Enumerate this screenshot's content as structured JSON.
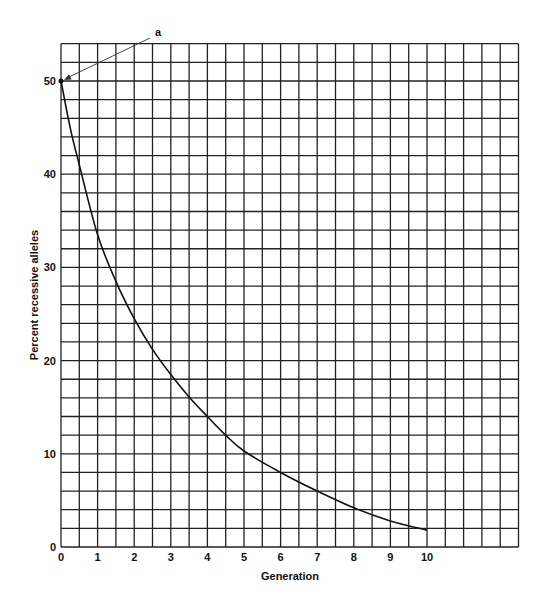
{
  "chart_data": {
    "type": "line",
    "title": "",
    "xlabel": "Generation",
    "ylabel": "Percent recessive alleles",
    "x_ticks": [
      "0",
      "1",
      "2",
      "3",
      "4",
      "5",
      "6",
      "7",
      "8",
      "9",
      "10"
    ],
    "y_ticks": [
      "0",
      "10",
      "20",
      "30",
      "40",
      "50"
    ],
    "xlim": [
      0,
      12.5
    ],
    "ylim": [
      0,
      54
    ],
    "grid": true,
    "grid_step_x": 0.5,
    "grid_step_y": 2,
    "annotation": {
      "label": "a",
      "points_to": [
        0,
        50
      ]
    },
    "series": [
      {
        "name": "Percent recessive alleles",
        "x": [
          0,
          0.25,
          0.5,
          1,
          1.5,
          2,
          2.5,
          3,
          3.5,
          4,
          4.5,
          5,
          6,
          7,
          8,
          9,
          10
        ],
        "values": [
          50,
          45,
          41,
          33.5,
          28.5,
          24.5,
          21.2,
          18.5,
          16.1,
          14,
          12,
          10.3,
          8,
          6,
          4.2,
          2.8,
          1.8
        ]
      }
    ]
  }
}
